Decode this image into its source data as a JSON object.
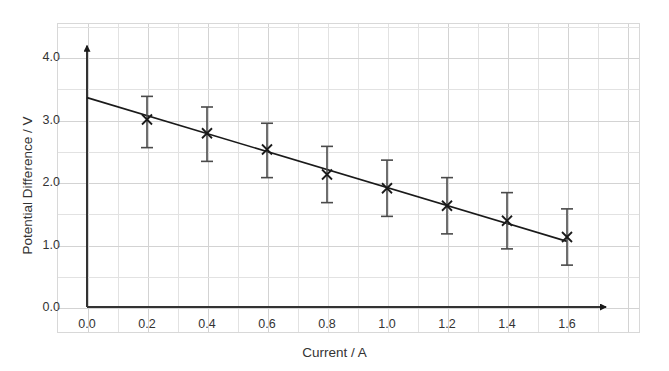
{
  "chart_data": {
    "type": "scatter",
    "title": "",
    "xlabel": "Current / A",
    "ylabel": "Potential Difference / V",
    "xlim": [
      0.0,
      1.8
    ],
    "ylim": [
      0.0,
      4.4
    ],
    "xticks": [
      "0.0",
      "0.2",
      "0.4",
      "0.6",
      "0.8",
      "1.0",
      "1.2",
      "1.4",
      "1.6"
    ],
    "xtick_values": [
      0.0,
      0.2,
      0.4,
      0.6,
      0.8,
      1.0,
      1.2,
      1.4,
      1.6
    ],
    "yticks": [
      "0.0",
      "1.0",
      "2.0",
      "3.0",
      "4.0"
    ],
    "ytick_values": [
      0.0,
      1.0,
      2.0,
      3.0,
      4.0
    ],
    "grid": true,
    "legend": "none",
    "marker": "cross-x",
    "error_bars": true,
    "x": [
      0.2,
      0.4,
      0.6,
      0.8,
      1.0,
      1.2,
      1.4,
      1.6
    ],
    "values": [
      3.0,
      2.78,
      2.52,
      2.12,
      1.9,
      1.62,
      1.38,
      1.12
    ],
    "yerr_upper": [
      0.37,
      0.42,
      0.42,
      0.45,
      0.45,
      0.45,
      0.45,
      0.45
    ],
    "yerr_lower": [
      0.45,
      0.45,
      0.45,
      0.45,
      0.45,
      0.45,
      0.45,
      0.45
    ],
    "series": [
      {
        "name": "measured points",
        "points": [
          {
            "x": 0.2,
            "y": 3.0,
            "err_up": 0.37,
            "err_dn": 0.45
          },
          {
            "x": 0.4,
            "y": 2.78,
            "err_up": 0.42,
            "err_dn": 0.45
          },
          {
            "x": 0.6,
            "y": 2.52,
            "err_up": 0.42,
            "err_dn": 0.45
          },
          {
            "x": 0.8,
            "y": 2.12,
            "err_up": 0.45,
            "err_dn": 0.45
          },
          {
            "x": 1.0,
            "y": 1.9,
            "err_up": 0.45,
            "err_dn": 0.45
          },
          {
            "x": 1.2,
            "y": 1.62,
            "err_up": 0.45,
            "err_dn": 0.45
          },
          {
            "x": 1.4,
            "y": 1.38,
            "err_up": 0.45,
            "err_dn": 0.45
          },
          {
            "x": 1.6,
            "y": 1.12,
            "err_up": 0.45,
            "err_dn": 0.45
          }
        ]
      },
      {
        "name": "line of best fit",
        "type": "line",
        "endpoints": [
          {
            "x": 0.0,
            "y": 3.35
          },
          {
            "x": 1.6,
            "y": 1.05
          }
        ],
        "intercept": 3.35,
        "gradient": -1.4375
      }
    ],
    "axis_style": "arrow-headed",
    "colors": {
      "line": "#1a1a1a",
      "marker": "#1a1a1a",
      "error_bar": "#4a4a4a",
      "axis": "#333333",
      "grid": "#e2e2e2",
      "background": "#ffffff"
    }
  }
}
